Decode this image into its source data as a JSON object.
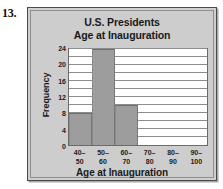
{
  "question_number": "13.",
  "chart_data": {
    "type": "bar",
    "title": "U.S. Presidents Age at Inauguration",
    "title_lines": [
      "U.S. Presidents",
      "Age at Inauguration"
    ],
    "xlabel": "Age at Inauguration",
    "ylabel": "Frequency",
    "categories": [
      "40–50",
      "50–60",
      "60–70",
      "70–80",
      "80–90",
      "90–100"
    ],
    "category_lines": [
      {
        "top": "40–",
        "bottom": "50"
      },
      {
        "top": "50–",
        "bottom": "60"
      },
      {
        "top": "60–",
        "bottom": "70"
      },
      {
        "top": "70–",
        "bottom": "80"
      },
      {
        "top": "80–",
        "bottom": "90"
      },
      {
        "top": "90–",
        "bottom": "100"
      }
    ],
    "values": [
      8,
      24,
      10,
      0,
      0,
      0
    ],
    "ylim": [
      0,
      24
    ],
    "ytick_labels": [
      "0",
      "4",
      "8",
      "12",
      "16",
      "20",
      "24"
    ],
    "ytick_values": [
      0,
      4,
      8,
      12,
      16,
      20,
      24
    ],
    "gridline_values": [
      2,
      4,
      6,
      8,
      10,
      12,
      14,
      16,
      18,
      20,
      22,
      24
    ],
    "grid": true,
    "legend": "none",
    "bar_color": "#9d9d9d",
    "plot_background": "#ffffff",
    "panel_background": "#cdcdcd",
    "text_color": "#1a1a1a"
  }
}
